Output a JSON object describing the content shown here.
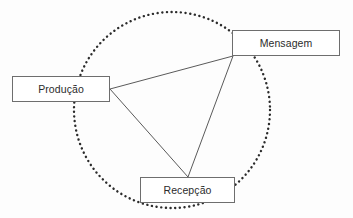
{
  "diagram": {
    "type": "circular-triangle-diagram",
    "background_color": "#fdfdfd",
    "stroke_color": "#6e6e6e",
    "dotted_circle": {
      "name": "dotted-circle",
      "center_x": 172,
      "center_y": 110,
      "radius": 98,
      "style": "dotted",
      "color": "#2b2b2b",
      "dot_size": 2.4,
      "dot_gap": 4.6
    },
    "nodes": [
      {
        "id": "producao",
        "label": "Produção",
        "x": 12,
        "y": 76,
        "width": 98,
        "height": 26
      },
      {
        "id": "mensagem",
        "label": "Mensagem",
        "x": 232,
        "y": 30,
        "width": 108,
        "height": 26
      },
      {
        "id": "recepcao",
        "label": "Recepção",
        "x": 140,
        "y": 177,
        "width": 95,
        "height": 26
      }
    ],
    "connectors": [
      {
        "id": "producao-mensagem",
        "from": "producao",
        "to": "mensagem",
        "x1": 110,
        "y1": 89,
        "x2": 233,
        "y2": 56
      },
      {
        "id": "producao-recepcao",
        "from": "producao",
        "to": "recepcao",
        "x1": 110,
        "y1": 89,
        "x2": 188,
        "y2": 177
      },
      {
        "id": "mensagem-recepcao",
        "from": "mensagem",
        "to": "recepcao",
        "x1": 233,
        "y1": 56,
        "x2": 188,
        "y2": 177
      }
    ]
  }
}
